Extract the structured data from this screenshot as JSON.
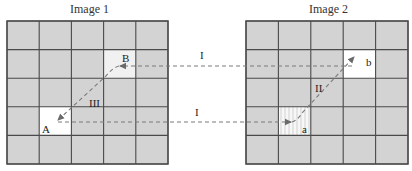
{
  "images": [
    {
      "title": "Image 1",
      "grid": {
        "x": 7,
        "y": 21,
        "width": 161,
        "height": 143,
        "rows": 5,
        "cols": 5
      },
      "highlighted_cells": [
        {
          "label": "B",
          "row": 1,
          "col": 3,
          "fill": "#f1f1f1"
        },
        {
          "label": "A",
          "row": 3,
          "col": 1,
          "fill": "#ffffff"
        }
      ]
    },
    {
      "title": "Image 2",
      "grid": {
        "x": 246,
        "y": 21,
        "width": 162,
        "height": 143,
        "rows": 5,
        "cols": 5
      },
      "highlighted_cells": [
        {
          "label": "b",
          "row": 1,
          "col": 3,
          "fill": "#ffffff"
        },
        {
          "label": "a",
          "row": 3,
          "col": 1,
          "fill": "#f4f4f4"
        }
      ]
    }
  ],
  "points": {
    "B": "B",
    "A": "A",
    "b": "b",
    "a": "a"
  },
  "paths": [
    {
      "label": "I",
      "from": "b",
      "to": "B",
      "style": "dashed"
    },
    {
      "label": "I",
      "from": "A",
      "to": "a",
      "style": "dashed"
    },
    {
      "label": "III",
      "from": "B",
      "to": "A",
      "style": "dashed"
    },
    {
      "label": "II",
      "from": "a",
      "to": "b",
      "style": "dashed"
    }
  ],
  "labels": {
    "path_top": "I",
    "path_bottom": "I",
    "path_left_diag": "III",
    "path_right_diag": "II"
  },
  "colors": {
    "cell_fill": "#d3d3d3",
    "grid_line": "#555555",
    "dash": "#7a7a7a"
  }
}
